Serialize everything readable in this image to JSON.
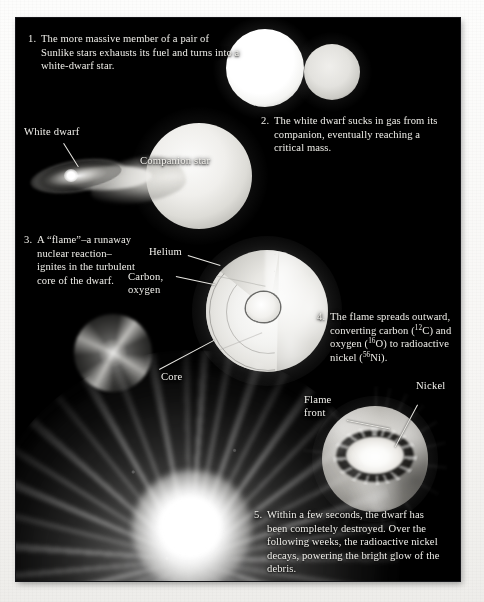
{
  "figure": {
    "background_color": "#000000",
    "page_color": "#faf9f7",
    "text_color": "#efeee9"
  },
  "steps": [
    {
      "number": "1.",
      "text": "The more massive member of a pair of Sunlike stars exhausts its fuel and turns into a white-dwarf star."
    },
    {
      "number": "2.",
      "text": "The white dwarf sucks in gas from its companion, eventually reaching a critical mass."
    },
    {
      "number": "3.",
      "text": "A “flame”–a runaway nuclear reaction–ignites in the turbulent core of the dwarf."
    },
    {
      "number": "4.",
      "text_parts": [
        "The flame spreads outward, converting carbon (",
        "12",
        "C) and oxygen (",
        "16",
        "O) to radioactive nickel (",
        "56",
        "Ni)."
      ],
      "text": "The flame spreads outward, converting carbon (12C) and oxygen (16O) to radioactive nickel (56Ni)."
    },
    {
      "number": "5.",
      "text": "Within a few seconds, the dwarf has been completely destroyed. Over the following weeks, the radioactive nickel decays, powering the bright glow of the debris."
    }
  ],
  "labels": {
    "white_dwarf": "White dwarf",
    "companion_star": "Companion star",
    "helium": "Helium",
    "carbon_oxygen": "Carbon,\noxygen",
    "core": "Core",
    "flame_front": "Flame\nfront",
    "nickel": "Nickel"
  },
  "isotopes": {
    "carbon": {
      "symbol": "C",
      "mass_number": "12"
    },
    "oxygen": {
      "symbol": "O",
      "mass_number": "16"
    },
    "nickel": {
      "symbol": "Ni",
      "mass_number": "56"
    }
  },
  "objects": {
    "star_massive": "massive-sunlike-star",
    "star_secondary": "secondary-sunlike-star",
    "companion": "companion-star-sphere",
    "accretion_disk": "accretion-disk",
    "white_dwarf_point": "white-dwarf-point",
    "turbulent_flame": "turbulent-spiral-flame",
    "cutaway_sphere": "cutaway-layered-dwarf",
    "nickel_sphere": "flame-front-nickel-sphere",
    "supernova": "supernova-explosion"
  }
}
